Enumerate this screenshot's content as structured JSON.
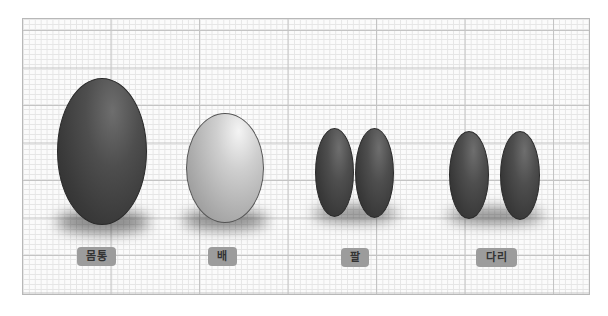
{
  "diagram": {
    "background": "grid-paper",
    "colors": {
      "dark_part": "#3a3a3a",
      "light_part": "#c8c8c8",
      "label_bg": "#9c9c9c",
      "label_text": "#333333",
      "grid_major": "#c4c4c4",
      "grid_minor": "#e6e6e6"
    },
    "parts": [
      {
        "label": "몸통",
        "shape": "large-oval",
        "count": 1,
        "shade": "dark"
      },
      {
        "label": "배",
        "shape": "medium-oval",
        "count": 1,
        "shade": "light"
      },
      {
        "label": "팔",
        "shape": "narrow-oval",
        "count": 2,
        "shade": "dark"
      },
      {
        "label": "다리",
        "shape": "narrow-oval",
        "count": 2,
        "shade": "dark"
      }
    ]
  }
}
